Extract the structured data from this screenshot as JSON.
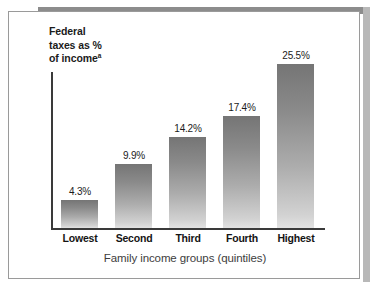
{
  "chart_data": {
    "type": "bar",
    "title": "",
    "subtitle": "",
    "xlabel": "Family income groups (quintiles)",
    "ylabel": "Federal taxes as % of income",
    "ylabel_superscript": "a",
    "categories": [
      "Lowest",
      "Second",
      "Third",
      "Fourth",
      "Highest"
    ],
    "values": [
      4.3,
      9.9,
      14.2,
      17.4,
      25.5
    ],
    "data_labels": [
      "4.3%",
      "9.9%",
      "14.2%",
      "17.4%",
      "25.5%"
    ],
    "ylim": [
      0,
      28
    ],
    "grid": false,
    "legend": null,
    "series": [
      {
        "name": "Federal taxes as % of income",
        "values": [
          4.3,
          9.9,
          14.2,
          17.4,
          25.5
        ]
      }
    ],
    "bar_fill": "#9a9a9a",
    "bar_gradient_top": "#757575",
    "bar_gradient_bottom": "#e2e2e2",
    "axis_color": "#3a3a3a",
    "text_color": "#1b1b1b",
    "frame_color": "#9a9a9a",
    "shadow_color": "#8c8c8c",
    "background": "#ffffff"
  },
  "axis": {
    "y_title_line1": "Federal",
    "y_title_line2": "taxes as %",
    "y_title_line3": "of income",
    "y_title_note": "a",
    "x_title": "Family income groups (quintiles)"
  }
}
